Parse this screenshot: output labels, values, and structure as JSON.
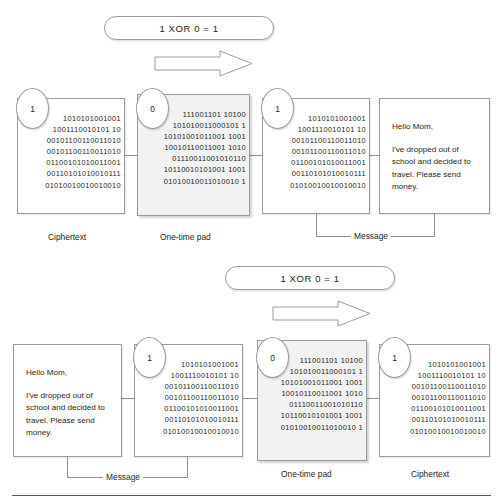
{
  "figure": {
    "rule_color": "#58595b",
    "accent_border": "#9a9a9a",
    "pad_fill": "#f2f2f2"
  },
  "bits": {
    "ciphertext_lines": [
      "1010101001001",
      "1001110010101 10",
      "00101100110011010",
      "00101100110011010",
      "01100101010011001",
      "00110101010010111",
      "01010010010010010"
    ],
    "ciphertext_block": "1010101001001\n1001110010101 10\n00101100110011010\n00101100110011010\n01100101010011001\n00110101010010111\n01010010010010010",
    "pad_lines": [
      "111001101 10100",
      "101010011000101 1",
      "10101001011001 1001",
      "10010110011001 1010",
      "01110011001010110",
      "10110010101001 1001",
      "01010010011010010 1"
    ],
    "pad_block": "111001101 10100\n101010011000101 1\n10101001011001 1001\n10010110011001 1010\n01110011001010110\n10110010101001 1001\n01010010011010010 1",
    "message_bits_block": "1010101001001\n1001110010101 10\n00101100110011010\n00101100110011010\n01100101010011001\n00110101010010111\n01010010010010010"
  },
  "message": {
    "greeting": "Hello Mom,",
    "body": "I've dropped out of school and decided to travel. Please send money."
  },
  "bubbles": {
    "one": "1",
    "zero": "0"
  },
  "equation": {
    "text": "1 XOR 0 = 1"
  },
  "labels": {
    "ciphertext": "Ciphertext",
    "one_time_pad": "One-time pad",
    "message": "Message"
  },
  "top_row": {
    "order": [
      "Ciphertext",
      "One-time pad",
      "Message"
    ],
    "direction": "decryption"
  },
  "bottom_row": {
    "order": [
      "Message",
      "One-time pad",
      "Ciphertext"
    ],
    "direction": "encryption"
  }
}
